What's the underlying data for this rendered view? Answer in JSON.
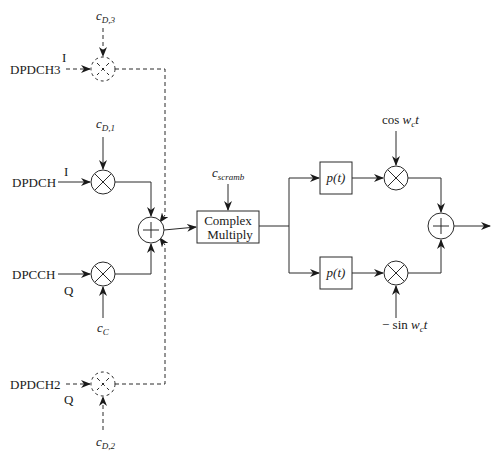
{
  "diagram": {
    "inputs": {
      "dpdch3": {
        "label": "DPDCH3",
        "branch": "I",
        "code": "c",
        "code_sub": "D,3"
      },
      "dpdch": {
        "label": "DPDCH",
        "branch": "I",
        "code": "c",
        "code_sub": "D,1"
      },
      "dpcch": {
        "label": "DPCCH",
        "branch": "Q",
        "code": "c",
        "code_sub": "C"
      },
      "dpdch2": {
        "label": "DPDCH2",
        "branch": "Q",
        "code": "c",
        "code_sub": "D,2"
      }
    },
    "scrambling": {
      "code": "c",
      "code_sub": "scramb"
    },
    "complex_multiply": {
      "line1": "Complex",
      "line2": "Multiply"
    },
    "pulse_shape_top": {
      "label": "p(t)"
    },
    "pulse_shape_bottom": {
      "label": "p(t)"
    },
    "carrier_top": {
      "prefix": "cos ",
      "var": "w",
      "var_sub": "c",
      "suffix": "t"
    },
    "carrier_bottom": {
      "prefix": "− sin ",
      "var": "w",
      "var_sub": "c",
      "suffix": "t"
    },
    "symbols": {
      "multiply": "×",
      "add": "+"
    }
  }
}
